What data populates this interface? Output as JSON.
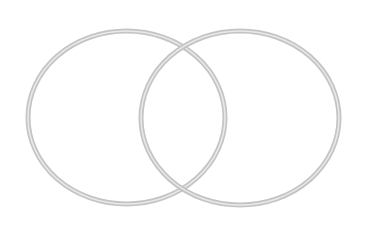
{
  "diagram": {
    "type": "venn",
    "background": "#ffffff",
    "stroke_outer_color": "#c4c4c4",
    "stroke_inner_color": "#e8e8e8",
    "stroke_outer_width": 5,
    "stroke_inner_width": 1.6,
    "sets": [
      {
        "name": "set-a",
        "label": "",
        "cx": 126.5,
        "cy": 117.5,
        "rx": 98.5,
        "ry": 86.5
      },
      {
        "name": "set-b",
        "label": "",
        "cx": 240,
        "cy": 118,
        "rx": 99,
        "ry": 87
      }
    ]
  }
}
